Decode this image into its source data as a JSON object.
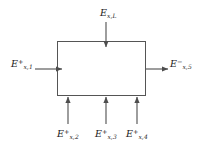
{
  "figure": {
    "type": "control-volume-energy-balance-diagram",
    "background_color": "#ffffff",
    "line_color": "#4d4d4d",
    "text_color": "#1a1a1a"
  },
  "control_volume": {
    "name": "control-volume",
    "x": 57,
    "y": 41,
    "width": 89,
    "height": 55
  },
  "flows": [
    {
      "id": "top",
      "direction": "inbound-down",
      "symbol": "E",
      "subscript": "x,L",
      "superscript": "",
      "label_text": "E x,L",
      "arrow_x": 106,
      "arrow_from_y": 22,
      "arrow_to_y": 47
    },
    {
      "id": "left",
      "direction": "inbound-right",
      "symbol": "E",
      "subscript": "x,1",
      "superscript": "+",
      "label_text": "E + x,1",
      "arrow_y": 69,
      "arrow_from_x": 36,
      "arrow_to_x": 62
    },
    {
      "id": "right",
      "direction": "outbound-right",
      "symbol": "E",
      "subscript": "x,5",
      "superscript": "−",
      "label_text": "E - x,5",
      "arrow_y": 69,
      "arrow_from_x": 146,
      "arrow_to_x": 168
    },
    {
      "id": "bottom-2",
      "direction": "inbound-up",
      "symbol": "E",
      "subscript": "x,2",
      "superscript": "+",
      "label_text": "E + x,2",
      "arrow_x": 68,
      "arrow_from_y": 124,
      "arrow_to_y": 98
    },
    {
      "id": "bottom-3",
      "direction": "inbound-up",
      "symbol": "E",
      "subscript": "x,3",
      "superscript": "+",
      "label_text": "E + x,3",
      "arrow_x": 106,
      "arrow_from_y": 124,
      "arrow_to_y": 98
    },
    {
      "id": "bottom-4",
      "direction": "inbound-up",
      "symbol": "E",
      "subscript": "x,4",
      "superscript": "+",
      "label_text": "E + x,4",
      "arrow_x": 137,
      "arrow_from_y": 124,
      "arrow_to_y": 98
    }
  ],
  "labels": {
    "top": {
      "symbol": "E",
      "sub": "x,L",
      "sup": ""
    },
    "left": {
      "symbol": "E",
      "sub": "x,1",
      "sup": "+"
    },
    "right": {
      "symbol": "E",
      "sub": "x,5",
      "sup": "−"
    },
    "bottom_2": {
      "symbol": "E",
      "sub": "x,2",
      "sup": "+"
    },
    "bottom_3": {
      "symbol": "E",
      "sub": "x,3",
      "sup": "+"
    },
    "bottom_4": {
      "symbol": "E",
      "sub": "x,4",
      "sup": "+"
    }
  }
}
